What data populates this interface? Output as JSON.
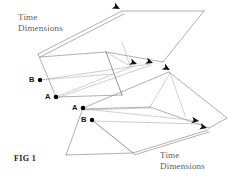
{
  "figure": {
    "caption": "FIG 1",
    "type": "technical-line-diagram",
    "background_color": "#ffffff",
    "line_color": "#8e8e8e",
    "dotted_line_color": "#a2a2a2",
    "arrow_color": "#101010",
    "dot_color": "#080808"
  },
  "labels": {
    "top_left": {
      "line1": "Time",
      "line2": "Dimensions"
    },
    "bottom_right": {
      "line1": "Time",
      "line2": "Dimensions"
    }
  },
  "points": {
    "upper_plane": [
      {
        "id": "B",
        "label": "B",
        "label_x": 29,
        "label_y": 79,
        "dot_x": 40,
        "dot_y": 80
      },
      {
        "id": "A",
        "label": "A",
        "label_x": 45,
        "label_y": 96,
        "dot_x": 56,
        "dot_y": 97
      }
    ],
    "lower_plane": [
      {
        "id": "A",
        "label": "A",
        "label_x": 72,
        "label_y": 107,
        "dot_x": 83,
        "dot_y": 108
      },
      {
        "id": "B",
        "label": "B",
        "label_x": 81,
        "label_y": 121,
        "dot_x": 92,
        "dot_y": 120
      }
    ]
  },
  "arrows": [
    {
      "id": "arrow-upper-top",
      "x": 120,
      "y": 9,
      "angle": 28
    },
    {
      "id": "arrow-upper-mid-left",
      "x": 136,
      "y": 64,
      "angle": 22
    },
    {
      "id": "arrow-upper-mid-right",
      "x": 152,
      "y": 63,
      "angle": 22
    },
    {
      "id": "arrow-lower-top",
      "x": 170,
      "y": 70,
      "angle": 28
    },
    {
      "id": "arrow-lower-right-upper",
      "x": 196,
      "y": 121,
      "angle": 14
    },
    {
      "id": "arrow-lower-right-lower",
      "x": 204,
      "y": 127,
      "angle": 14
    }
  ],
  "geometry": {
    "upper_plane_outline": "38,54 56,97 123,95 105,52",
    "upper_plane_top_panel": "38,54 123,12 205,11 105,52",
    "lower_plane_outline": "66,155 83,108 150,107 133,153",
    "lower_plane_top_panel": "83,108 170,72 228,118 150,107"
  }
}
